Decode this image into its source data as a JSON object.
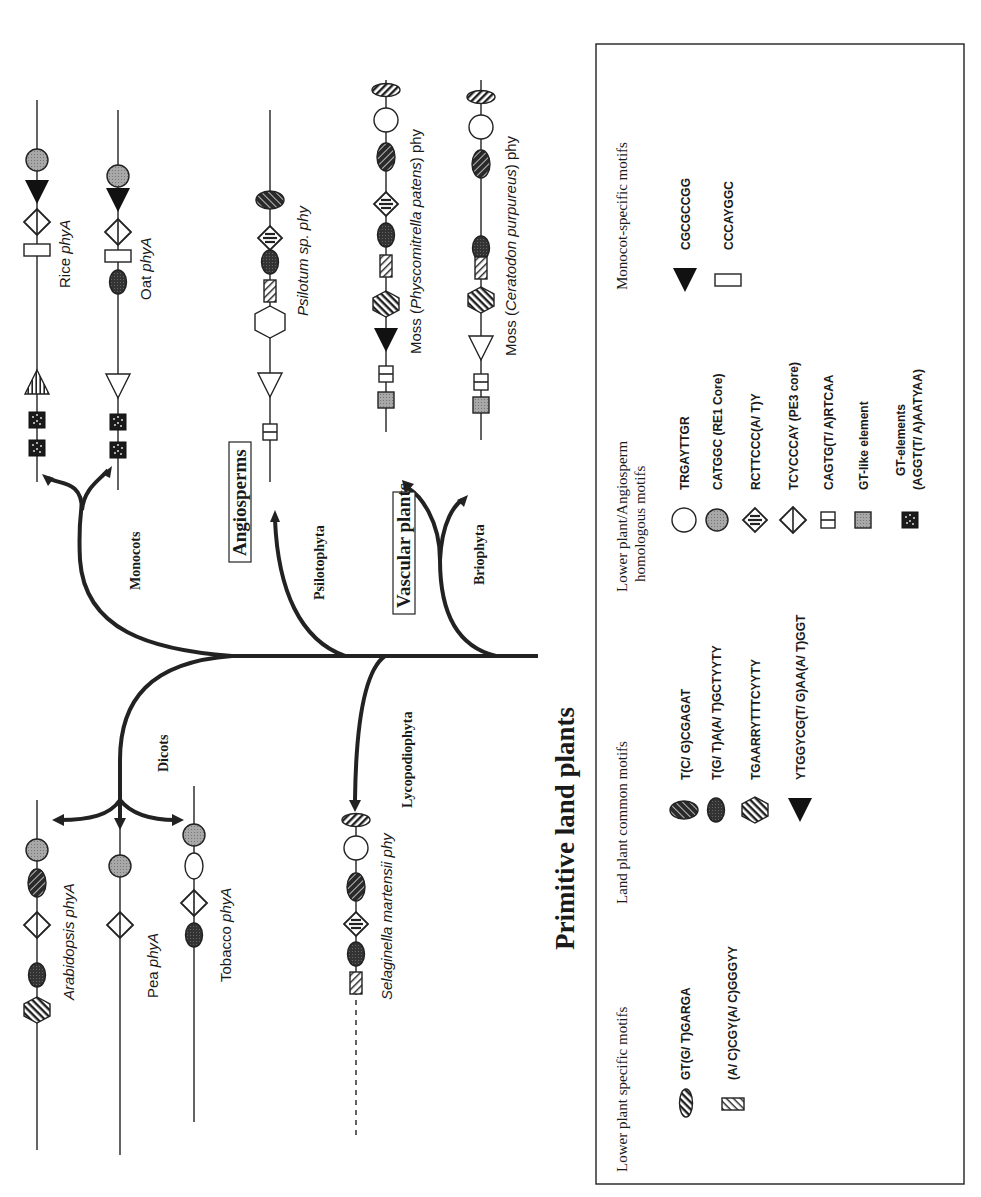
{
  "figure": {
    "orientation": "rotated 90 degrees counter-clockwise",
    "root_label": "Primitive land plants",
    "clades": {
      "angiosperms": "Angiosperms",
      "vascular_plants": "Vascular plants"
    },
    "branches": {
      "monocots": "Monocots",
      "dicots": "Dicots",
      "psilotophyta": "Psilotophyta",
      "lycopodiophyta": "Lycopodiophyta",
      "briophyta": "Briophyta"
    },
    "genes": [
      {
        "id": "rice",
        "label_prefix": "Rice ",
        "label_italic": "phyA",
        "motifs_5to3": [
          "gt-elements",
          "gt-elements",
          "trgayttgr-striped-variant",
          "ccc-rect",
          "tcycccay-diamond",
          "cgcgccgg-triangle",
          "catggc-circle"
        ]
      },
      {
        "id": "oat",
        "label_prefix": "Oat ",
        "label_italic": "phyA",
        "motifs_5to3": [
          "gt-elements",
          "gt-elements",
          "open-triangle",
          "dark-oval",
          "ccc-rect",
          "tcycccay-diamond",
          "cgcgccgg-triangle",
          "catggc-circle"
        ]
      },
      {
        "id": "psilotum",
        "label_prefix": "",
        "label_italic": "Psilotum sp. phy",
        "motifs_5to3": [
          "cagtg-box",
          "open-triangle",
          "open-hexagon",
          "striped-rect",
          "dark-oval",
          "rcttccc-diamond",
          "hatched-oval"
        ]
      },
      {
        "id": "moss-physcomitrella",
        "label_prefix": "Moss (",
        "label_italic": "Physcomitrella patens",
        "label_suffix": ") phy",
        "motifs_5to3": [
          "gt-like",
          "cagtg-box",
          "filled-triangle",
          "striped-hexagon",
          "striped-rect",
          "dark-oval",
          "rcttccc-diamond",
          "hatched-oval",
          "open-circle",
          "striped-oval"
        ]
      },
      {
        "id": "moss-ceratodon",
        "label_prefix": "Moss (",
        "label_italic": "Ceratodon purpureus",
        "label_suffix": ") phy",
        "motifs_5to3": [
          "gt-like",
          "cagtg-box",
          "open-triangle",
          "striped-hexagon",
          "striped-rect",
          "dark-oval",
          "hatched-oval",
          "open-circle",
          "striped-oval"
        ]
      },
      {
        "id": "arabidopsis",
        "label_prefix": "",
        "label_italic": "Arabidopsis phyA",
        "motifs_5to3": [
          "striped-hexagon",
          "dark-oval",
          "tcycccay-diamond",
          "hatched-oval",
          "catggc-circle"
        ]
      },
      {
        "id": "pea",
        "label_prefix": "Pea ",
        "label_italic": "phyA",
        "motifs_5to3": [
          "tcycccay-diamond",
          "catggc-circle"
        ]
      },
      {
        "id": "tobacco",
        "label_prefix": "Tobacco ",
        "label_italic": "phyA",
        "motifs_5to3": [
          "dark-oval",
          "tcycccay-diamond",
          "open-oval",
          "catggc-circle"
        ]
      },
      {
        "id": "selaginella",
        "label_prefix": "",
        "label_italic": "Selaginella martensii phy",
        "motifs_5to3": [
          "striped-rect",
          "dark-oval",
          "rcttccc-diamond",
          "hatched-oval",
          "open-circle",
          "striped-oval"
        ]
      }
    ]
  },
  "legend": {
    "lower_plant_specific": {
      "title": "Lower plant specific motifs",
      "items": [
        {
          "symbol": "striped-oval",
          "text": "GT(G/ T)GARGA"
        },
        {
          "symbol": "striped-rect",
          "text": "(A/ C)CGY(A/ C)GGGYY"
        }
      ]
    },
    "land_plant_common": {
      "title": "Land plant common motifs",
      "items": [
        {
          "symbol": "hatched-oval",
          "text": "T(C/ G)CGAGAT"
        },
        {
          "symbol": "dark-oval",
          "text": "T(G/ T)A(A/ T)GCTYYTY"
        },
        {
          "symbol": "striped-hexagon",
          "text": "TGAARRYTTTCYYTY"
        },
        {
          "symbol": "filled-triangle",
          "text": "YTGGYCG(T/ G)AA(A/ T)GGT"
        }
      ]
    },
    "lower_angiosperm_homologous": {
      "title_line1": "Lower plant/Angiosperm",
      "title_line2": "homologous motifs",
      "items": [
        {
          "symbol": "open-circle",
          "text": "TRGAYTTGR"
        },
        {
          "symbol": "grey-circle",
          "text": "CATGGC  (RE1  Core)"
        },
        {
          "symbol": "rcttccc-diamond",
          "text": "RCTTCCC(A/ T)Y"
        },
        {
          "symbol": "tcycccay-diamond",
          "text": "TCYCCCAY  (PE3  core)"
        },
        {
          "symbol": "cagtg-box",
          "text": "CAGTG(T/ A)RTCAA"
        },
        {
          "symbol": "gt-like",
          "text": "GT-like  element"
        },
        {
          "symbol": "gt-elements",
          "text_line1": "GT-elements",
          "text_line2": "(AGGT(T/ A)AATYAA)"
        }
      ]
    },
    "monocot_specific": {
      "title": "Monocot-specific motifs",
      "items": [
        {
          "symbol": "filled-triangle",
          "text": "CGCGCCGG"
        },
        {
          "symbol": "open-rect",
          "text": "CCCAYGGC"
        }
      ]
    }
  }
}
